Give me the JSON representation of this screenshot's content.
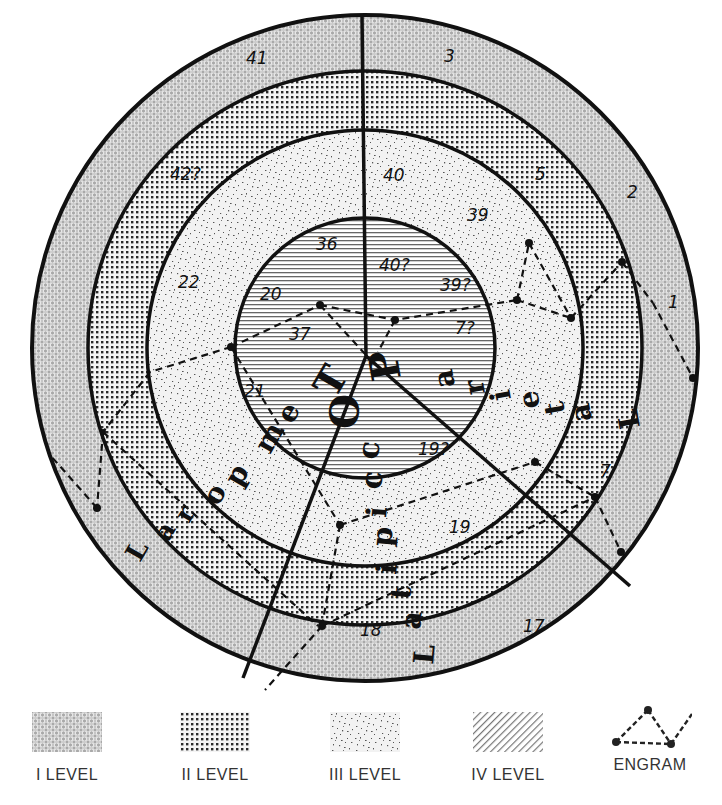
{
  "figure": {
    "type": "concentric brain cortex scheme",
    "levels": [
      {
        "id": "I",
        "label": "I LEVEL",
        "pattern": "circle-lattice",
        "fill": "#b9b9b9"
      },
      {
        "id": "II",
        "label": "II LEVEL",
        "pattern": "dot-grid",
        "fill": "#e6e6e6"
      },
      {
        "id": "III",
        "label": "III LEVEL",
        "pattern": "speckle",
        "fill": "#f0f0f0"
      },
      {
        "id": "IV",
        "label": "IV LEVEL",
        "pattern": "hatch",
        "fill": "#ffffff"
      }
    ],
    "engram_label": "ENGRAM",
    "area_numbers": {
      "ring1": [
        "41",
        "3",
        "2",
        "1",
        "17"
      ],
      "ring2": [
        "42?",
        "5",
        "7",
        "18"
      ],
      "ring3": [
        "22",
        "40",
        "39",
        "19"
      ],
      "ring4": [
        "36",
        "20",
        "37",
        "40?",
        "39?",
        "7?",
        "21",
        "19?"
      ]
    },
    "lobes": {
      "parietal": [
        "P",
        "a",
        "r",
        "i",
        "e",
        "t",
        "a",
        "L"
      ],
      "temporal": [
        "T",
        "e",
        "m",
        "p",
        "o",
        "r",
        "a",
        "L"
      ],
      "occipital": [
        "O",
        "c",
        "c",
        "i",
        "p",
        "i",
        "t",
        "a",
        "L"
      ]
    }
  },
  "legend": {
    "items": [
      {
        "label": "I LEVEL"
      },
      {
        "label": "II LEVEL"
      },
      {
        "label": "III LEVEL"
      },
      {
        "label": "IV LEVEL"
      },
      {
        "label": "ENGRAM"
      }
    ]
  },
  "labels": {
    "n41": "41",
    "n3": "3",
    "n2": "2",
    "n1": "1",
    "n17": "17",
    "n42q": "42?",
    "n5": "5",
    "n7": "7",
    "n18": "18",
    "n22": "22",
    "n40": "40",
    "n39": "39",
    "n19": "19",
    "n36": "36",
    "n20": "20",
    "n37": "37",
    "n40q": "40?",
    "n39q": "39?",
    "n7q": "7?",
    "n21": "21",
    "n19q": "19?"
  },
  "lobe_letters": {
    "T": "T",
    "e1": "e",
    "m": "m",
    "p1": "p",
    "o1": "o",
    "r1": "r",
    "a1": "a",
    "L1": "L",
    "O": "O",
    "c1": "c",
    "c2": "c",
    "i1": "i",
    "p2": "p",
    "i2": "i",
    "t1": "t",
    "a2": "a",
    "L2": "L",
    "P": "P",
    "a3": "a",
    "r2": "r",
    "i3": "i",
    "e2": "e",
    "t2": "t",
    "a4": "a",
    "L3": "L"
  }
}
